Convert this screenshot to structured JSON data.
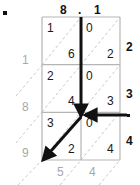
{
  "diagram": {
    "type": "lattice-multiplication",
    "title_hidden": true,
    "colors": {
      "grid_line": "#b5b5b5",
      "diagonal_dashed": "#c9c9c9",
      "arrow": "#111111",
      "gray_label": "#a8a8a8",
      "black_label": "#111111",
      "cell_digit": "#1a1a1a"
    }
  },
  "top_labels": [
    {
      "text": "8",
      "x": 60,
      "y": 4
    },
    {
      "text": ".",
      "x": 78,
      "y": 4
    },
    {
      "text": "1",
      "x": 94,
      "y": 4
    }
  ],
  "right_labels": [
    {
      "text": "2",
      "x": 126,
      "y": 41
    },
    {
      "text": "3",
      "x": 126,
      "y": 88
    },
    {
      "text": "4",
      "x": 126,
      "y": 135
    }
  ],
  "right_dot": {
    "x": 127,
    "y": 114,
    "size": 3
  },
  "top_left_dot": {
    "x": 3,
    "y": 11,
    "size": 4
  },
  "left_labels": [
    {
      "text": "1",
      "x": 22,
      "y": 54
    },
    {
      "text": "8",
      "x": 22,
      "y": 101
    },
    {
      "text": "9",
      "x": 22,
      "y": 147
    }
  ],
  "bottom_labels": [
    {
      "text": "5",
      "x": 57,
      "y": 166
    },
    {
      "text": "4",
      "x": 89,
      "y": 166
    }
  ],
  "grid": {
    "x": 42,
    "y": 17,
    "width": 78,
    "height": 143,
    "cols": 2,
    "rows": 3,
    "col_width": 39,
    "row_height": 47.67,
    "cells": [
      {
        "row": 0,
        "col": 0,
        "upper": "1",
        "lower": "6"
      },
      {
        "row": 0,
        "col": 1,
        "upper": "0",
        "lower": "2"
      },
      {
        "row": 1,
        "col": 0,
        "upper": "2",
        "lower": "4"
      },
      {
        "row": 1,
        "col": 1,
        "upper": "0",
        "lower": "3"
      },
      {
        "row": 2,
        "col": 0,
        "upper": "3",
        "lower": "2"
      },
      {
        "row": 2,
        "col": 1,
        "upper": "0",
        "lower": "4"
      }
    ]
  },
  "arrows": {
    "vertical_down": {
      "x1": 81,
      "y1": 17,
      "x2": 81,
      "y2": 116
    },
    "horizontal_left": {
      "x1": 127,
      "y1": 115,
      "x2": 85,
      "y2": 115
    },
    "diagonal_down_left": {
      "x1": 81,
      "y1": 117,
      "x2": 43,
      "y2": 160
    }
  },
  "dashed_diagonals": [
    {
      "x1": 42,
      "y1": 65,
      "x2": 81,
      "y2": 17
    },
    {
      "x1": 81,
      "y1": 65,
      "x2": 120,
      "y2": 17
    },
    {
      "x1": 42,
      "y1": 112,
      "x2": 81,
      "y2": 65
    },
    {
      "x1": 81,
      "y1": 112,
      "x2": 120,
      "y2": 65
    },
    {
      "x1": 42,
      "y1": 160,
      "x2": 81,
      "y2": 112
    },
    {
      "x1": 81,
      "y1": 160,
      "x2": 120,
      "y2": 112
    },
    {
      "x1": 16,
      "y1": 96,
      "x2": 42,
      "y2": 65
    },
    {
      "x1": 16,
      "y1": 143,
      "x2": 42,
      "y2": 112
    },
    {
      "x1": 18,
      "y1": 185,
      "x2": 42,
      "y2": 160
    },
    {
      "x1": 60,
      "y1": 185,
      "x2": 81,
      "y2": 160
    },
    {
      "x1": 99,
      "y1": 185,
      "x2": 120,
      "y2": 160
    }
  ]
}
